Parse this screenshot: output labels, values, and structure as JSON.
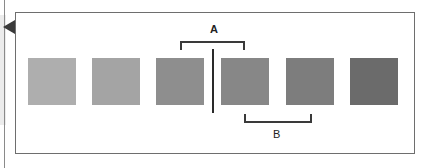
{
  "diagram": {
    "swatches": [
      {
        "id": 1,
        "color": "#aeaeae"
      },
      {
        "id": 2,
        "color": "#a4a4a4"
      },
      {
        "id": 3,
        "color": "#8e8e8e"
      },
      {
        "id": 4,
        "color": "#878787"
      },
      {
        "id": 5,
        "color": "#7d7d7d"
      },
      {
        "id": 6,
        "color": "#6b6b6b"
      }
    ],
    "bracket_a": {
      "label": "A",
      "spans": "swatch 3 to swatch 4 (above)"
    },
    "bracket_b": {
      "label": "B",
      "spans": "swatch 4 to swatch 5 (below)"
    },
    "divider": "vertical line between swatch 3 and swatch 4"
  }
}
